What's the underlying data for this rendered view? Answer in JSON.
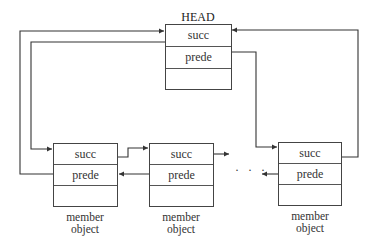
{
  "head": {
    "title": "HEAD",
    "fields": [
      "succ",
      "prede",
      ""
    ]
  },
  "members": [
    {
      "fields": [
        "succ",
        "prede",
        ""
      ],
      "caption_line1": "member",
      "caption_line2": "object"
    },
    {
      "fields": [
        "succ",
        "prede",
        ""
      ],
      "caption_line1": "member",
      "caption_line2": "object"
    },
    {
      "fields": [
        "succ",
        "prede",
        ""
      ],
      "caption_line1": "member",
      "caption_line2": "object"
    }
  ],
  "ellipsis": "· · ·",
  "colors": {
    "line": "#333333",
    "box": "#444444",
    "background": "#ffffff"
  }
}
